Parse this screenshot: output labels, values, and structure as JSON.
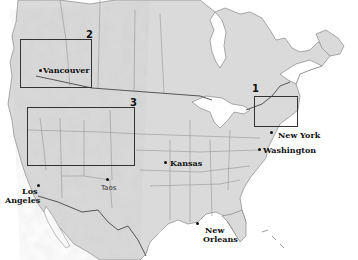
{
  "map": {
    "colors": {
      "land": "#d9d9d9",
      "land_shade": "#c4c4c4",
      "water": "#ffffff",
      "border": "#555555",
      "box": "#333333",
      "text": "#111111"
    },
    "regions": [
      {
        "number": "1",
        "name": "region-1-new-england",
        "box": {
          "x": 254,
          "y": 96,
          "w": 44,
          "h": 31
        },
        "label_pos": {
          "x": 252,
          "y": 84
        }
      },
      {
        "number": "2",
        "name": "region-2-british-columbia",
        "box": {
          "x": 20,
          "y": 39,
          "w": 72,
          "h": 49
        },
        "label_pos": {
          "x": 87,
          "y": 29
        }
      },
      {
        "number": "3",
        "name": "region-3-rocky-mountains",
        "box": {
          "x": 27,
          "y": 107,
          "w": 108,
          "h": 59
        },
        "label_pos": {
          "x": 130,
          "y": 98
        }
      }
    ],
    "cities": [
      {
        "name": "Vancouver",
        "dot": {
          "x": 40,
          "y": 70
        },
        "label": {
          "x": 43,
          "y": 66
        },
        "bold": true
      },
      {
        "name": "New York",
        "dot": {
          "x": 271,
          "y": 132
        },
        "label": {
          "x": 278,
          "y": 131
        },
        "bold": true
      },
      {
        "name": "Washington",
        "dot": {
          "x": 258,
          "y": 149
        },
        "label": {
          "x": 263,
          "y": 146
        },
        "bold": true
      },
      {
        "name": "Kansas",
        "dot": {
          "x": 165,
          "y": 162
        },
        "label": {
          "x": 170,
          "y": 159
        },
        "bold": true
      },
      {
        "name": "Taos",
        "dot": {
          "x": 106,
          "y": 179
        },
        "label": {
          "x": 101,
          "y": 184
        },
        "bold": false
      },
      {
        "name": "Los",
        "dot": {
          "x": 37,
          "y": 185
        },
        "label": {
          "x": 22,
          "y": 187
        },
        "bold": true
      },
      {
        "name": "Angeles",
        "label": {
          "x": 5,
          "y": 196
        },
        "bold": true
      },
      {
        "name": "New",
        "dot": {
          "x": 197,
          "y": 223
        },
        "label": {
          "x": 204,
          "y": 226
        },
        "bold": true
      },
      {
        "name": "Orleans",
        "label": {
          "x": 203,
          "y": 235
        },
        "bold": true
      }
    ]
  }
}
